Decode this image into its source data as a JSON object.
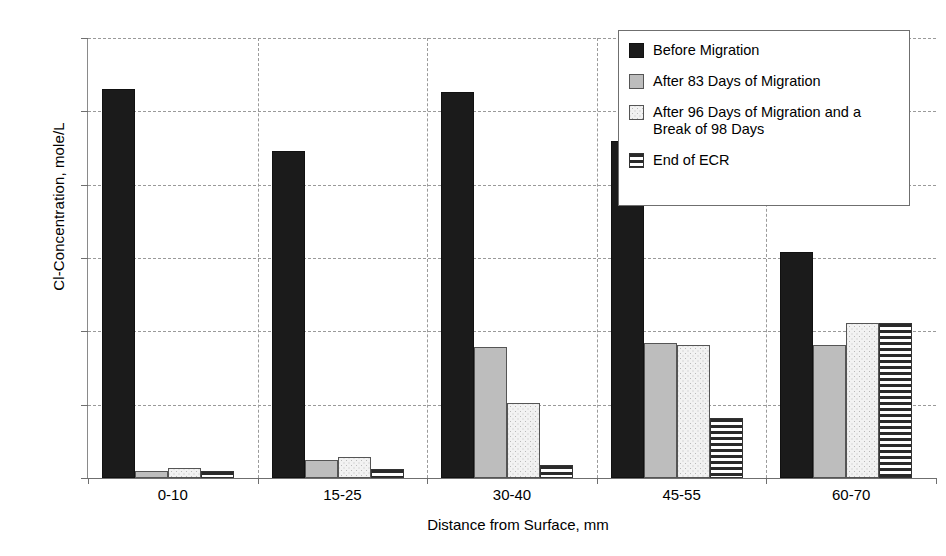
{
  "chart_data": {
    "type": "bar",
    "title": "",
    "xlabel": "Distance from Surface, mm",
    "ylabel": "Cl-Concentration, mole/L",
    "categories": [
      "0-10",
      "15-25",
      "30-40",
      "45-55",
      "60-70"
    ],
    "ylim": [
      0,
      3
    ],
    "ytick_labels": [
      "0",
      "0,5",
      "1",
      "1,5",
      "2",
      "2,5",
      "3"
    ],
    "ytick_values": [
      0,
      0.5,
      1,
      1.5,
      2,
      2.5,
      3
    ],
    "grid": true,
    "legend_position": "top-right inside plot",
    "series": [
      {
        "name": "Before Migration",
        "pattern": "solid-black",
        "color": "#1b1b1b",
        "values": [
          2.65,
          2.23,
          2.63,
          2.3,
          1.54
        ]
      },
      {
        "name": "After 83 Days of Migration",
        "pattern": "solid-gray",
        "color": "#bdbdbd",
        "values": [
          0.05,
          0.12,
          0.89,
          0.92,
          0.91
        ]
      },
      {
        "name": "After 96 Days of Migration and a Break of 98 Days",
        "pattern": "fine-dots",
        "color": "#f2f2f2",
        "values": [
          0.07,
          0.14,
          0.51,
          0.91,
          1.06
        ]
      },
      {
        "name": "End of ECR",
        "pattern": "horizontal-lines",
        "color": "#ffffff",
        "values": [
          0.05,
          0.06,
          0.09,
          0.41,
          1.06
        ]
      }
    ]
  },
  "legend": {
    "items": [
      "Before Migration",
      "After 83 Days of Migration",
      "After 96 Days of Migration and a Break of 98 Days",
      "End of ECR"
    ]
  }
}
